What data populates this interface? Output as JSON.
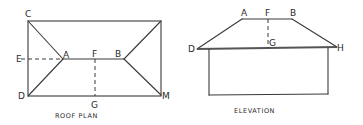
{
  "roof_plan": {
    "caption": "ROOF PLAN",
    "labels": {
      "C": "C",
      "E": "E",
      "A": "A",
      "F": "F",
      "B": "B",
      "D": "D",
      "G": "G",
      "M": "M"
    }
  },
  "elevation": {
    "caption": "ELEVATION",
    "labels": {
      "A": "A",
      "F": "F",
      "B": "B",
      "D": "D",
      "G": "G",
      "H": "H"
    }
  }
}
